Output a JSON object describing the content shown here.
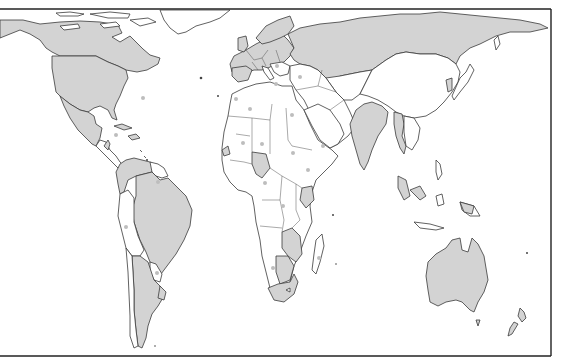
{
  "map": {
    "type": "world-political-outline",
    "projection": "equal-area cylindrical (Gall-Peters style)",
    "colors": {
      "background": "#ffffff",
      "shaded_land": "#d3d3d3",
      "unshaded_land": "#ffffff",
      "outline": "#3a3a3a",
      "marker": "#bdbdbd",
      "frame": "#222222"
    },
    "shaded_regions": [
      "Canada",
      "United States",
      "Mexico",
      "Western Europe",
      "Russia",
      "India",
      "Thailand/Myanmar region",
      "Brazil",
      "Argentina",
      "Colombia/Venezuela region",
      "Nigeria",
      "Kenya",
      "Mozambique/Zimbabwe/Zambia region",
      "South Africa",
      "Australia",
      "New Zealand",
      "Indonesia (partial)"
    ],
    "markers": [
      {
        "region": "Mid-Atlantic",
        "x": 143,
        "y": 98
      },
      {
        "region": "Caribbean",
        "x": 116,
        "y": 135
      },
      {
        "region": "Northwest Africa",
        "x": 236,
        "y": 99
      },
      {
        "region": "Algeria",
        "x": 250,
        "y": 109
      },
      {
        "region": "Mali",
        "x": 243,
        "y": 143
      },
      {
        "region": "Niger",
        "x": 262,
        "y": 144
      },
      {
        "region": "Libya",
        "x": 276,
        "y": 84
      },
      {
        "region": "Turkey",
        "x": 300,
        "y": 77
      },
      {
        "region": "Egypt",
        "x": 292,
        "y": 115
      },
      {
        "region": "Sudan",
        "x": 293,
        "y": 153
      },
      {
        "region": "Ethiopia",
        "x": 308,
        "y": 170
      },
      {
        "region": "Somalia",
        "x": 323,
        "y": 146
      },
      {
        "region": "Central Africa",
        "x": 265,
        "y": 183
      },
      {
        "region": "DR Congo",
        "x": 283,
        "y": 206
      },
      {
        "region": "Angola",
        "x": 273,
        "y": 268
      },
      {
        "region": "Madagascar",
        "x": 319,
        "y": 258
      },
      {
        "region": "Peru",
        "x": 126,
        "y": 227
      },
      {
        "region": "Paraguay",
        "x": 157,
        "y": 273
      },
      {
        "region": "Guyana",
        "x": 158,
        "y": 182
      },
      {
        "region": "Europe",
        "x": 277,
        "y": 66
      }
    ]
  }
}
